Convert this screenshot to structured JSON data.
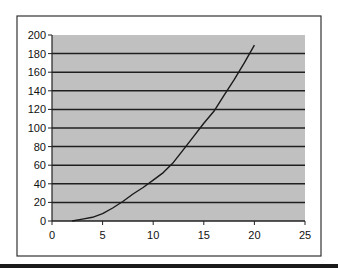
{
  "chart_data": {
    "type": "line",
    "title": "",
    "xlabel": "",
    "ylabel": "",
    "xlim": [
      0,
      25
    ],
    "ylim": [
      0,
      200
    ],
    "x_ticks": [
      0,
      5,
      10,
      15,
      20,
      25
    ],
    "y_ticks": [
      0,
      20,
      40,
      60,
      80,
      100,
      120,
      140,
      160,
      180,
      200
    ],
    "grid": {
      "horizontal": true,
      "vertical": false
    },
    "legend": null,
    "series": [
      {
        "name": "Series 1",
        "x": [
          2,
          3,
          4,
          5,
          6,
          7,
          8,
          9,
          10,
          11,
          12,
          13,
          14,
          15,
          16,
          17,
          18,
          19,
          20
        ],
        "values": [
          0,
          2,
          4,
          8,
          14,
          21,
          29,
          36,
          44,
          52,
          63,
          77,
          91,
          105,
          118,
          135,
          152,
          170,
          189
        ]
      }
    ]
  },
  "style": {
    "plot_background": "#c0c0c0",
    "gridline_color": "#1f1f1f",
    "line_color": "#1a1a1a",
    "frame_color": "#333333"
  }
}
